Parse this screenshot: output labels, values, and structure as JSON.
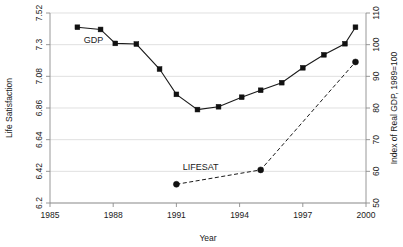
{
  "chart_data": {
    "type": "line",
    "title": "",
    "xlabel": "Year",
    "ylabel": "Life Satisfaction",
    "ylabel_right": "Index of Real GDP, 1989=100",
    "xlim": [
      1985,
      2000
    ],
    "ylim": [
      6.2,
      7.52
    ],
    "ylim_right": [
      50,
      110
    ],
    "grid": true,
    "grid_axis": "y",
    "legend_position": "inline-annotations",
    "xticks": [
      1985,
      1988,
      1991,
      1994,
      1997,
      2000
    ],
    "xtick_labels": [
      "1985",
      "1988",
      "1991",
      "1994",
      "1997",
      "2000"
    ],
    "yticks_left": [
      6.2,
      6.42,
      6.64,
      6.86,
      7.08,
      7.3,
      7.52
    ],
    "ytick_labels_left": [
      "6.2",
      "6.42",
      "6.64",
      "6.86",
      "7.08",
      "7.3",
      "7.52"
    ],
    "yticks_right": [
      50,
      60,
      70,
      80,
      90,
      100,
      110
    ],
    "ytick_labels_right": [
      "50",
      "60",
      "70",
      "80",
      "90",
      "100",
      "110"
    ],
    "series": [
      {
        "name": "GDP",
        "axis": "right",
        "marker": "square",
        "linestyle": "solid",
        "color": "#111111",
        "annotation": "GDP",
        "annotation_x": 1986.6,
        "annotation_y": 100.6,
        "x": [
          1986.3,
          1987.4,
          1988.1,
          1989.1,
          1990.2,
          1991.0,
          1992.0,
          1993.0,
          1994.1,
          1995.0,
          1996.0,
          1997.0,
          1998.0,
          1999.0,
          1999.5
        ],
        "values": [
          105.5,
          104.8,
          100.4,
          100.2,
          92.3,
          84.3,
          79.5,
          80.4,
          83.4,
          85.6,
          88.0,
          92.7,
          96.8,
          100.3,
          105.5
        ]
      },
      {
        "name": "LIFESAT",
        "axis": "left",
        "marker": "circle",
        "linestyle": "dashed",
        "color": "#111111",
        "annotation": "LIFESAT",
        "annotation_x": 1991.3,
        "annotation_y": 6.43,
        "x": [
          1991.0,
          1995.0,
          1999.5
        ],
        "values": [
          6.33,
          6.43,
          7.18
        ]
      }
    ]
  },
  "axes": {
    "x_title": "Year",
    "y_left_title": "Life Satisfaction",
    "y_right_title": "Index of Real GDP, 1989=100"
  }
}
